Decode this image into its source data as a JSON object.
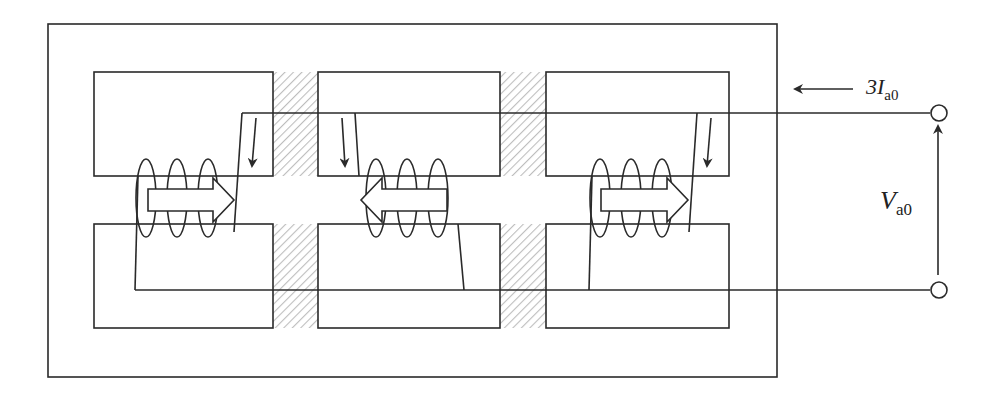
{
  "diagram": {
    "type": "three-legged transformer core, zero-sequence flux",
    "labels": {
      "current": {
        "prefix": "3I",
        "subscript": "a0"
      },
      "voltage": {
        "prefix": "V",
        "subscript": "a0"
      }
    },
    "legs": [
      {
        "name": "left",
        "flux_direction": "right"
      },
      {
        "name": "middle",
        "flux_direction": "left"
      },
      {
        "name": "right",
        "flux_direction": "right"
      }
    ],
    "colors": {
      "stroke": "#2a2a2a",
      "hatch": "#bdbdbd",
      "background": "#ffffff"
    }
  }
}
